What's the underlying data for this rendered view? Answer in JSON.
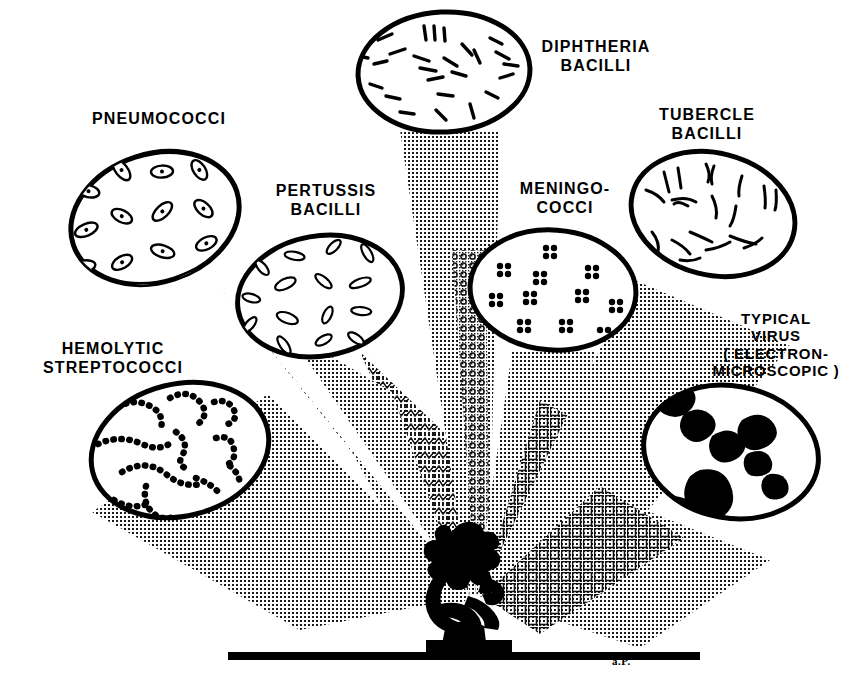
{
  "figure": {
    "background_color": "#ffffff",
    "ink_color": "#000000",
    "signature": "a.P."
  },
  "labels": {
    "diphtheria": "DIPHTHERIA\nBACILLI",
    "tubercle": "TUBERCLE\nBACILLI",
    "pneumococci": "PNEUMOCOCCI",
    "pertussis": "PERTUSSIS\nBACILLI",
    "meningococci": "MENINGO-\nCOCCI",
    "virus": "TYPICAL\nVIRUS\n( ELECTRON-\nMICROSCOPIC )",
    "streptococci": "HEMOLYTIC\nSTREPTOCOCCI"
  },
  "specimens": [
    {
      "id": "pneumococci",
      "label": "PNEUMOCOCCI",
      "morphology": "lancet-shaped diplococci, paired outlined ovals with central dots",
      "cx": 155,
      "cy": 218,
      "rx": 88,
      "ry": 66,
      "rot": -18,
      "beam_to": [
        470,
        596
      ]
    },
    {
      "id": "pertussis",
      "label": "PERTUSSIS BACILLI",
      "morphology": "small outlined ovoid coccobacilli scattered",
      "cx": 320,
      "cy": 296,
      "rx": 85,
      "ry": 62,
      "rot": -10,
      "beam_to": [
        470,
        596
      ]
    },
    {
      "id": "diphtheria",
      "label": "DIPHTHERIA BACILLI",
      "morphology": "short thick rods in palisade clusters",
      "cx": 444,
      "cy": 72,
      "rx": 88,
      "ry": 62,
      "rot": -3,
      "beam_to": [
        470,
        596
      ]
    },
    {
      "id": "meningococci",
      "label": "MENINGO-COCCI",
      "morphology": "solid black cocci in tetrads of four",
      "cx": 553,
      "cy": 290,
      "rx": 85,
      "ry": 62,
      "rot": 4,
      "beam_to": [
        470,
        596
      ]
    },
    {
      "id": "tubercle",
      "label": "TUBERCLE BACILLI",
      "morphology": "slender curved beaded rods",
      "cx": 713,
      "cy": 214,
      "rx": 85,
      "ry": 63,
      "rot": 14,
      "beam_to": [
        470,
        596
      ]
    },
    {
      "id": "streptococci",
      "label": "HEMOLYTIC STREPTOCOCCI",
      "morphology": "chains of small solid dots",
      "cx": 180,
      "cy": 450,
      "rx": 92,
      "ry": 68,
      "rot": -14,
      "beam_to": [
        470,
        596
      ]
    },
    {
      "id": "virus",
      "label": "TYPICAL VIRUS ( ELECTRON-MICROSCOPIC )",
      "morphology": "large irregular solid black crystalline masses",
      "cx": 731,
      "cy": 452,
      "rx": 90,
      "ry": 68,
      "rot": 10,
      "beam_to": [
        470,
        596
      ]
    }
  ],
  "microscope": {
    "name": "microscope-silhouette",
    "apex_x": 470,
    "apex_y": 596,
    "baseline_y": 659,
    "baseline_x1": 228,
    "baseline_x2": 700
  }
}
